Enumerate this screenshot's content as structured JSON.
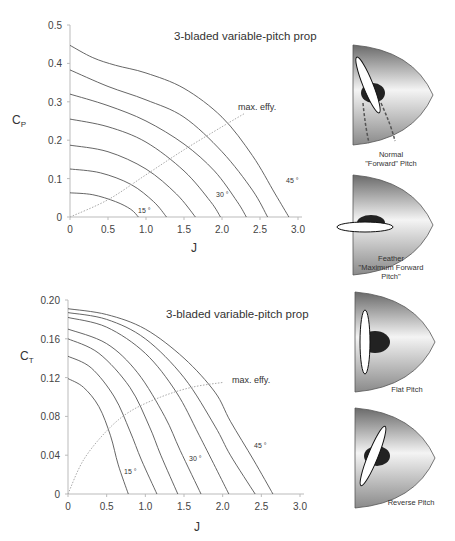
{
  "chart_data": [
    {
      "type": "line",
      "title": "3-bladed variable-pitch prop",
      "xlabel": "J",
      "ylabel": "C_P",
      "ylabel_main": "C",
      "ylabel_sub": "P",
      "xlim": [
        0,
        3.0
      ],
      "ylim": [
        0,
        0.5
      ],
      "xticks": [
        "0",
        "0.5",
        "1.0",
        "1.5",
        "2.0",
        "2.5",
        "3.0"
      ],
      "yticks": [
        "0",
        "0.1",
        "0.2",
        "0.3",
        "0.4",
        "0.5"
      ],
      "grid": false,
      "annotations": [
        "15 °",
        "30 °",
        "45 °",
        "max. effy."
      ],
      "series": [
        {
          "name": "15°",
          "points": [
            [
              0,
              0.063
            ],
            [
              0.3,
              0.058
            ],
            [
              0.6,
              0.04
            ],
            [
              0.8,
              0.02
            ],
            [
              0.9,
              0
            ]
          ]
        },
        {
          "name": "20°",
          "points": [
            [
              0,
              0.125
            ],
            [
              0.4,
              0.115
            ],
            [
              0.8,
              0.085
            ],
            [
              1.1,
              0.04
            ],
            [
              1.27,
              0
            ]
          ]
        },
        {
          "name": "25°",
          "points": [
            [
              0,
              0.187
            ],
            [
              0.5,
              0.17
            ],
            [
              1.0,
              0.125
            ],
            [
              1.4,
              0.06
            ],
            [
              1.65,
              0
            ]
          ]
        },
        {
          "name": "30°",
          "points": [
            [
              0,
              0.255
            ],
            [
              0.5,
              0.235
            ],
            [
              1.0,
              0.195
            ],
            [
              1.5,
              0.12
            ],
            [
              1.85,
              0.04
            ],
            [
              1.98,
              0
            ]
          ]
        },
        {
          "name": "35°",
          "points": [
            [
              0,
              0.32
            ],
            [
              0.5,
              0.29
            ],
            [
              1.0,
              0.25
            ],
            [
              1.5,
              0.19
            ],
            [
              1.9,
              0.12
            ],
            [
              2.2,
              0.04
            ],
            [
              2.32,
              0
            ]
          ]
        },
        {
          "name": "40°",
          "points": [
            [
              0,
              0.383
            ],
            [
              0.5,
              0.34
            ],
            [
              1.0,
              0.305
            ],
            [
              1.5,
              0.26
            ],
            [
              2.0,
              0.17
            ],
            [
              2.4,
              0.07
            ],
            [
              2.6,
              0
            ]
          ]
        },
        {
          "name": "45°",
          "points": [
            [
              0,
              0.447
            ],
            [
              0.3,
              0.415
            ],
            [
              0.6,
              0.395
            ],
            [
              1.0,
              0.375
            ],
            [
              1.5,
              0.335
            ],
            [
              2.0,
              0.26
            ],
            [
              2.4,
              0.16
            ],
            [
              2.7,
              0.06
            ],
            [
              2.88,
              0
            ]
          ]
        },
        {
          "name": "max. effy.",
          "style": "dotted",
          "points": [
            [
              0,
              0
            ],
            [
              0.5,
              0.045
            ],
            [
              1.0,
              0.11
            ],
            [
              1.5,
              0.175
            ],
            [
              2.0,
              0.235
            ],
            [
              2.3,
              0.27
            ]
          ]
        }
      ]
    },
    {
      "type": "line",
      "title": "3-bladed variable-pitch prop",
      "xlabel": "J",
      "ylabel": "C_T",
      "ylabel_main": "C",
      "ylabel_sub": "T",
      "xlim": [
        0,
        3.0
      ],
      "ylim": [
        0,
        0.2
      ],
      "xticks": [
        "0",
        "0.5",
        "1.0",
        "1.5",
        "2.0",
        "2.5",
        "3.0"
      ],
      "yticks": [
        "0",
        "0.04",
        "0.08",
        "0.12",
        "0.16",
        "0.20"
      ],
      "grid": false,
      "annotations": [
        "15 °",
        "30 °",
        "45 °",
        "max. effy."
      ],
      "series": [
        {
          "name": "15°",
          "points": [
            [
              0,
              0.119
            ],
            [
              0.2,
              0.11
            ],
            [
              0.4,
              0.09
            ],
            [
              0.55,
              0.06
            ],
            [
              0.65,
              0.03
            ],
            [
              0.78,
              0
            ]
          ]
        },
        {
          "name": "20°",
          "points": [
            [
              0,
              0.142
            ],
            [
              0.3,
              0.13
            ],
            [
              0.6,
              0.1
            ],
            [
              0.8,
              0.065
            ],
            [
              0.95,
              0.035
            ],
            [
              1.15,
              0
            ]
          ]
        },
        {
          "name": "25°",
          "points": [
            [
              0,
              0.16
            ],
            [
              0.4,
              0.145
            ],
            [
              0.8,
              0.11
            ],
            [
              1.05,
              0.07
            ],
            [
              1.2,
              0.04
            ],
            [
              1.42,
              0
            ]
          ]
        },
        {
          "name": "30°",
          "points": [
            [
              0,
              0.17
            ],
            [
              0.5,
              0.155
            ],
            [
              0.9,
              0.125
            ],
            [
              1.25,
              0.08
            ],
            [
              1.45,
              0.045
            ],
            [
              1.72,
              0
            ]
          ]
        },
        {
          "name": "35°",
          "points": [
            [
              0,
              0.182
            ],
            [
              0.5,
              0.172
            ],
            [
              1.0,
              0.145
            ],
            [
              1.4,
              0.105
            ],
            [
              1.7,
              0.06
            ],
            [
              2.08,
              0
            ]
          ]
        },
        {
          "name": "40°",
          "points": [
            [
              0,
              0.187
            ],
            [
              0.5,
              0.18
            ],
            [
              1.0,
              0.16
            ],
            [
              1.5,
              0.12
            ],
            [
              1.9,
              0.07
            ],
            [
              2.1,
              0.04
            ],
            [
              2.42,
              0
            ]
          ]
        },
        {
          "name": "45°",
          "points": [
            [
              0,
              0.191
            ],
            [
              0.5,
              0.185
            ],
            [
              1.0,
              0.17
            ],
            [
              1.5,
              0.14
            ],
            [
              1.9,
              0.105
            ],
            [
              2.1,
              0.075
            ],
            [
              2.4,
              0.035
            ],
            [
              2.65,
              0
            ]
          ]
        },
        {
          "name": "max. effy.",
          "style": "dotted",
          "points": [
            [
              0,
              0
            ],
            [
              0.2,
              0.035
            ],
            [
              0.5,
              0.065
            ],
            [
              0.8,
              0.085
            ],
            [
              1.2,
              0.1
            ],
            [
              1.6,
              0.11
            ],
            [
              2.0,
              0.115
            ]
          ]
        }
      ]
    }
  ],
  "illustrations": [
    {
      "label_lines": [
        "Normal",
        "\"Forward\" Pitch"
      ],
      "blade": "forward"
    },
    {
      "label_lines": [
        "Feather",
        "\"Maximum Forward",
        "Pitch\""
      ],
      "blade": "feather"
    },
    {
      "label_lines": [
        "Flat Pitch"
      ],
      "blade": "flat"
    },
    {
      "label_lines": [
        "Reverse Pitch"
      ],
      "blade": "reverse"
    }
  ]
}
